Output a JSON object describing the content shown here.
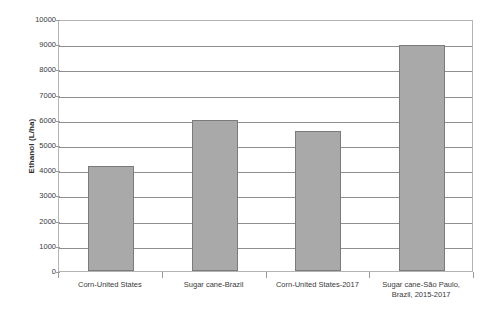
{
  "chart_data": {
    "type": "bar",
    "title": "",
    "xlabel": "",
    "ylabel": "Ethanol (L/ha)",
    "ylim": [
      0,
      10000
    ],
    "ytick_step": 1000,
    "yticks": [
      "10000",
      "9000",
      "8000",
      "7000",
      "6000",
      "5000",
      "4000",
      "3000",
      "2000",
      "1000",
      "0"
    ],
    "grid": true,
    "legend": "none",
    "bar_color": "#a9a9a9",
    "bar_border_color": "#7b7b7b",
    "categories": [
      "Corn-United States",
      "Sugar cane-Brazil",
      "Corn-United States-2017",
      "Sugar cane-São Paulo, Brazil, 2015-2017"
    ],
    "category_lines": [
      [
        "Corn-United States"
      ],
      [
        "Sugar cane-Brazil"
      ],
      [
        "Corn-United States-2017"
      ],
      [
        "Sugar cane-São Paulo,",
        "Brazil, 2015-2017"
      ]
    ],
    "values": [
      4150,
      5980,
      5550,
      8950
    ],
    "series": [
      {
        "name": "Ethanol yield",
        "values": [
          4150,
          5980,
          5550,
          8950
        ]
      }
    ]
  }
}
